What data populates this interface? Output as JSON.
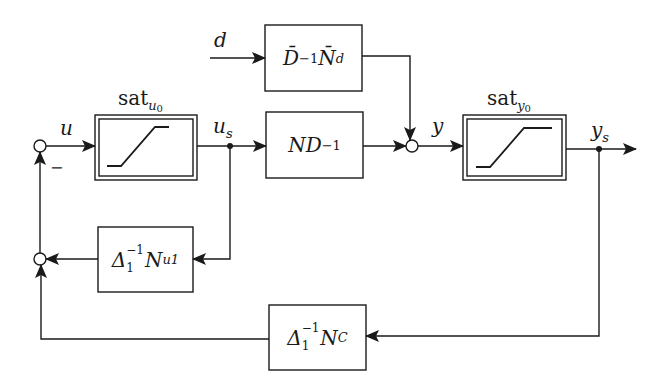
{
  "diagram": {
    "type": "block-diagram",
    "colors": {
      "stroke": "#1a1a1a",
      "background": "#ffffff"
    },
    "signals": {
      "u": "u",
      "u_s_main": "u",
      "u_s_sub": "s",
      "y": "y",
      "y_s_main": "y",
      "y_s_sub": "s",
      "d": "d",
      "minus": "−"
    },
    "blocks": {
      "sat_u": {
        "title_main": "sat",
        "title_sub": "u",
        "title_subsub": "0",
        "kind": "saturation"
      },
      "sat_y": {
        "title_main": "sat",
        "title_sub": "y",
        "title_subsub": "0",
        "kind": "saturation"
      },
      "disturbance": {
        "p1": "D̄",
        "p1_sup": "−1",
        "p2": "N̄",
        "p2_sub": "d"
      },
      "plant": {
        "p1": "ND",
        "p1_sup": "−1"
      },
      "anti_windup_u": {
        "p1": "Δ",
        "p1_sup": "−1",
        "p1_sub": "1",
        "p2": "N",
        "p2_sub": "u1"
      },
      "controller": {
        "p1": "Δ",
        "p1_sup": "−1",
        "p1_sub": "1",
        "p2": "N",
        "p2_sub": "C"
      }
    }
  }
}
